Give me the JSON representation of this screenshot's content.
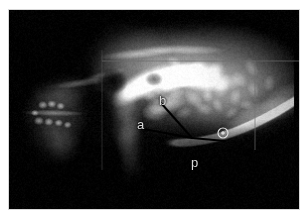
{
  "figure": {
    "kind": "radiograph",
    "modality_caption": "lateral temporomandibular joint radiograph",
    "plate_background": "#000000",
    "page_background": "#ffffff",
    "border_color": "#d8d8d8"
  },
  "annotations": {
    "label_color": "#d9d9d9",
    "line_color": "#000000",
    "items": [
      {
        "id": "label-b",
        "text": "b",
        "x": 150,
        "y": 84,
        "size": "sz-md"
      },
      {
        "id": "label-a",
        "text": "a",
        "x": 128,
        "y": 108,
        "size": "sz-md"
      },
      {
        "id": "label-p",
        "text": "p",
        "x": 182,
        "y": 146,
        "size": "sz-md"
      }
    ],
    "marker": {
      "id": "circled-marker",
      "glyph": "@",
      "x": 214,
      "y": 123,
      "radius": 5
    },
    "measurement_lines": [
      {
        "id": "line-b-to-vertex",
        "from_x": 152,
        "from_y": 93,
        "to_x": 183,
        "to_y": 128
      },
      {
        "id": "line-a-to-vertex",
        "from_x": 129,
        "from_y": 118,
        "to_x": 183,
        "to_y": 128
      },
      {
        "id": "line-vertex-to-marker",
        "from_x": 183,
        "from_y": 128,
        "to_x": 216,
        "to_y": 131
      }
    ],
    "reference_grid": {
      "horizontal_y": 51,
      "horizontal_x1": 93,
      "horizontal_x2": 300,
      "vertical_x": 246,
      "vertical_y1": 51,
      "vertical_y2": 140,
      "left_vertical_x": 93,
      "left_vertical_y1": 40,
      "left_vertical_y2": 160,
      "color": "#6e6e6e"
    }
  }
}
